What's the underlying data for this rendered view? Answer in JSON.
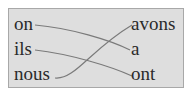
{
  "diagram": {
    "left_words": [
      "on",
      "ils",
      "nous"
    ],
    "right_words": [
      "avons",
      "a",
      "ont"
    ],
    "connections": [
      {
        "from": "on",
        "to": "a"
      },
      {
        "from": "ils",
        "to": "ont"
      },
      {
        "from": "nous",
        "to": "avons"
      }
    ],
    "colors": {
      "background": "#dedede",
      "border": "#a8a8a8",
      "line": "#808080",
      "text": "#2a2a2a"
    }
  }
}
